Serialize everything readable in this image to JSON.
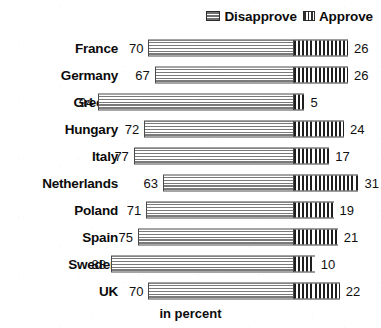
{
  "legend": {
    "entries": [
      {
        "label": "Disapprove",
        "swatch": "horizontal-stripes-icon",
        "color": "#7a7a7a"
      },
      {
        "label": "Approve",
        "swatch": "vertical-stripes-icon",
        "color": "#1f1f1f"
      }
    ]
  },
  "axis_caption": "in percent",
  "chart_data": {
    "type": "bar",
    "orientation": "horizontal",
    "stacked": "diverging",
    "title": "",
    "subtitle": "",
    "xlabel": "in percent",
    "ylabel": "",
    "xlim": [
      0,
      100
    ],
    "grid": false,
    "legend_position": "top-right",
    "split_axis_px": 294,
    "categories": [
      "France",
      "Germany",
      "Greece",
      "Hungary",
      "Italy",
      "Netherlands",
      "Poland",
      "Spain",
      "Sweden",
      "UK"
    ],
    "series": [
      {
        "name": "Disapprove",
        "direction": "left",
        "values": [
          70,
          67,
          94,
          72,
          77,
          63,
          71,
          75,
          88,
          70
        ]
      },
      {
        "name": "Approve",
        "direction": "right",
        "values": [
          26,
          26,
          5,
          24,
          17,
          31,
          19,
          21,
          10,
          22
        ]
      }
    ],
    "rows": [
      {
        "country": "France",
        "disapprove": 70,
        "approve": 26
      },
      {
        "country": "Germany",
        "disapprove": 67,
        "approve": 26
      },
      {
        "country": "Greece",
        "disapprove": 94,
        "approve": 5
      },
      {
        "country": "Hungary",
        "disapprove": 72,
        "approve": 24
      },
      {
        "country": "Italy",
        "disapprove": 77,
        "approve": 17
      },
      {
        "country": "Netherlands",
        "disapprove": 63,
        "approve": 31
      },
      {
        "country": "Poland",
        "disapprove": 71,
        "approve": 19
      },
      {
        "country": "Spain",
        "disapprove": 75,
        "approve": 21
      },
      {
        "country": "Sweden",
        "disapprove": 88,
        "approve": 10
      },
      {
        "country": "UK",
        "disapprove": 70,
        "approve": 22
      }
    ]
  }
}
